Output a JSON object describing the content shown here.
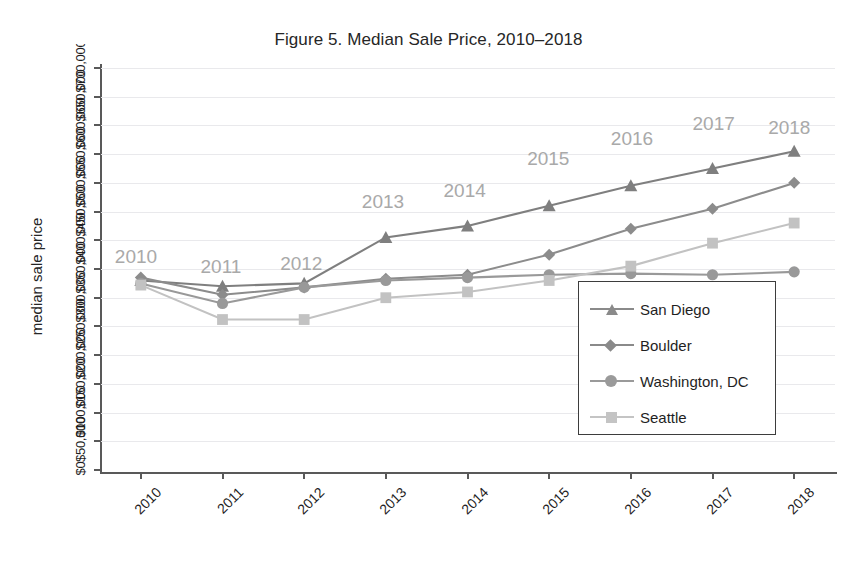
{
  "chart_data": {
    "type": "line",
    "title": "Figure 5. Median Sale Price, 2010–2018",
    "xlabel": "",
    "ylabel": "median sale price",
    "grid": true,
    "legend_position": "inside-right",
    "categories": [
      "2010",
      "2011",
      "2012",
      "2013",
      "2014",
      "2015",
      "2016",
      "2017",
      "2018"
    ],
    "ylim": [
      0,
      700000
    ],
    "ytick_labels": [
      "$0",
      "$50,000",
      "$100,000",
      "$150,000",
      "$200,000",
      "$250,000",
      "$300,000",
      "$350,000",
      "$400,000",
      "$450,000",
      "$500,000",
      "$550,000",
      "$600,000",
      "$650,000",
      "$700,000"
    ],
    "point_annotations": [
      "2010",
      "2011",
      "2012",
      "2013",
      "2014",
      "2015",
      "2016",
      "2017",
      "2018"
    ],
    "series": [
      {
        "name": "San Diego",
        "marker": "triangle",
        "color": "#7f7f7f",
        "values": [
          330000,
          320000,
          325000,
          405000,
          425000,
          460000,
          495000,
          525000,
          555000
        ]
      },
      {
        "name": "Boulder",
        "marker": "diamond",
        "color": "#8c8c8c",
        "values": [
          335000,
          305000,
          318000,
          333000,
          340000,
          375000,
          420000,
          455000,
          500000
        ]
      },
      {
        "name": "Washington, DC",
        "marker": "circle",
        "color": "#999999",
        "values": [
          325000,
          290000,
          318000,
          330000,
          335000,
          340000,
          342000,
          340000,
          345000
        ]
      },
      {
        "name": "Seattle",
        "marker": "square",
        "color": "#c2c2c2",
        "values": [
          322000,
          262000,
          262000,
          300000,
          310000,
          330000,
          355000,
          395000,
          430000
        ]
      }
    ]
  },
  "legend": {
    "items": [
      {
        "label": "San Diego"
      },
      {
        "label": "Boulder"
      },
      {
        "label": "Washington, DC"
      },
      {
        "label": "Seattle"
      }
    ]
  }
}
